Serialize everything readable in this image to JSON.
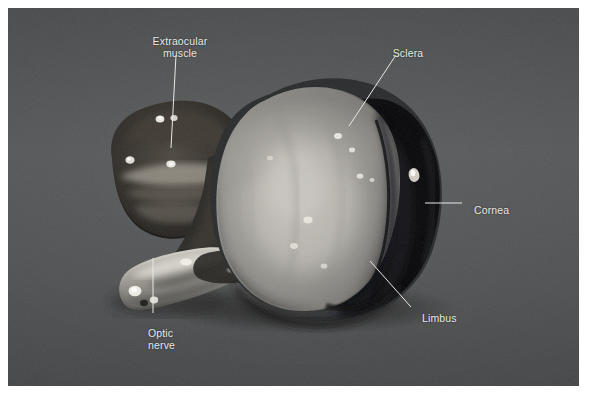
{
  "figure": {
    "kind": "anatomical-photograph",
    "background_color": "#4f5051",
    "plate_border_color": "#ffffff",
    "label_color": "#e9e9e7",
    "leader_color": "#e8e8e6"
  },
  "labels": [
    {
      "id": "extraocular-muscle",
      "text": "Extraocular\nmuscle",
      "align": "center",
      "leader": {
        "x1": 176,
        "y1": 55,
        "x2": 171,
        "y2": 148
      }
    },
    {
      "id": "sclera",
      "text": "Sclera",
      "align": "center",
      "leader": {
        "x1": 396,
        "y1": 55,
        "x2": 349,
        "y2": 126
      }
    },
    {
      "id": "cornea",
      "text": "Cornea",
      "align": "left",
      "leader": {
        "x1": 425,
        "y1": 203,
        "x2": 462,
        "y2": 203
      }
    },
    {
      "id": "limbus",
      "text": "Limbus",
      "align": "left",
      "leader": {
        "x1": 370,
        "y1": 261,
        "x2": 411,
        "y2": 307
      }
    },
    {
      "id": "optic-nerve",
      "text": "Optic\nnerve",
      "align": "left",
      "leader": {
        "x1": 153,
        "y1": 258,
        "x2": 153,
        "y2": 313
      }
    }
  ],
  "structures": [
    {
      "id": "sclera-body",
      "name": "Sclera",
      "tone": "pale mottled gray-white"
    },
    {
      "id": "cornea-body",
      "name": "Cornea",
      "tone": "near black translucent"
    },
    {
      "id": "limbus-edge",
      "name": "Limbus",
      "tone": "dark rim between sclera and cornea"
    },
    {
      "id": "extraocular-muscle-body",
      "name": "Extraocular muscle",
      "tone": "dark lobed tissue with highlights"
    },
    {
      "id": "optic-nerve-body",
      "name": "Optic nerve",
      "tone": "pale cylindrical stump"
    }
  ]
}
